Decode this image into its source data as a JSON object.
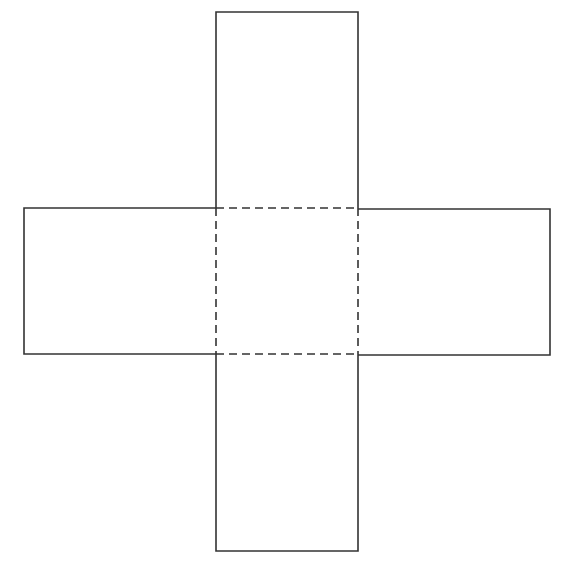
{
  "diagram": {
    "type": "cube-net-cross",
    "stroke_color": "#333333",
    "stroke_width": 1.6,
    "dash_pattern": "8 5",
    "background": "#ffffff",
    "faces": [
      {
        "name": "top",
        "x": 216,
        "y": 12,
        "w": 142,
        "h": 196,
        "style": "solid"
      },
      {
        "name": "left",
        "x": 24,
        "y": 208,
        "w": 192,
        "h": 146,
        "style": "solid"
      },
      {
        "name": "center",
        "x": 216,
        "y": 208,
        "w": 142,
        "h": 146,
        "style": "dashed"
      },
      {
        "name": "right",
        "x": 358,
        "y": 209,
        "w": 192,
        "h": 146,
        "style": "solid"
      },
      {
        "name": "bottom",
        "x": 216,
        "y": 354,
        "w": 142,
        "h": 197,
        "style": "solid"
      }
    ]
  }
}
